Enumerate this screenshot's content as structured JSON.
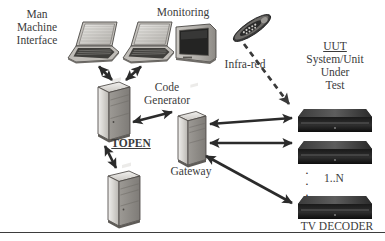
{
  "diagram": {
    "background": "#ffffff",
    "line_color": "#2b2b2b",
    "device_fill_light": "#d8d6d2",
    "device_fill_dark": "#1d1d1d",
    "rule_color": "#3d3d3d"
  },
  "labels": {
    "man_machine_interface": {
      "line1": "Man",
      "line2": "Machine",
      "line3": "Interface"
    },
    "monitoring": "Monitoring",
    "code_generator": {
      "line1": "Code",
      "line2": "Generator"
    },
    "topen": "TOPEN",
    "gateway": "Gateway",
    "infra_red": "Infra-red",
    "uut": {
      "abbrev": "UUT",
      "line1": "System/Unit",
      "line2": "Under",
      "line3": "Test"
    },
    "multiplicity": "1..N",
    "tv_decoder": "TV DECODER",
    "vertical_dots": "·"
  },
  "nodes": [
    {
      "id": "laptop-mmi",
      "type": "laptop",
      "label": "Man Machine Interface"
    },
    {
      "id": "laptop-monitoring",
      "type": "laptop",
      "label": "Monitoring"
    },
    {
      "id": "crt-monitor",
      "type": "monitor",
      "label": "Monitoring"
    },
    {
      "id": "remote-control",
      "type": "remote",
      "label": "Infra-red"
    },
    {
      "id": "tower-code-generator",
      "type": "tower",
      "label": "Code Generator"
    },
    {
      "id": "tower-gateway",
      "type": "tower",
      "label": "Gateway"
    },
    {
      "id": "tower-topen-node",
      "type": "tower",
      "label": ""
    },
    {
      "id": "decoder-1",
      "type": "decoder",
      "label": "TV DECODER"
    },
    {
      "id": "decoder-2",
      "type": "decoder",
      "label": "TV DECODER"
    },
    {
      "id": "decoder-n",
      "type": "decoder",
      "label": "TV DECODER"
    }
  ],
  "connections": [
    {
      "from": "laptop-mmi",
      "to": "tower-code-generator",
      "style": "solid",
      "arrows": "both"
    },
    {
      "from": "laptop-monitoring",
      "to": "tower-code-generator",
      "style": "solid",
      "arrows": "both"
    },
    {
      "from": "tower-code-generator",
      "to": "tower-gateway",
      "style": "solid",
      "arrows": "both",
      "label": "TOPEN"
    },
    {
      "from": "tower-code-generator",
      "to": "tower-topen-node",
      "style": "solid",
      "arrows": "both",
      "label": "TOPEN"
    },
    {
      "from": "remote-control",
      "to": "decoder-1",
      "style": "dashed",
      "arrows": "end",
      "label": "Infra-red"
    },
    {
      "from": "tower-gateway",
      "to": "decoder-1",
      "style": "solid",
      "arrows": "both"
    },
    {
      "from": "tower-gateway",
      "to": "decoder-2",
      "style": "solid",
      "arrows": "both"
    },
    {
      "from": "tower-gateway",
      "to": "decoder-n",
      "style": "solid",
      "arrows": "both"
    }
  ]
}
